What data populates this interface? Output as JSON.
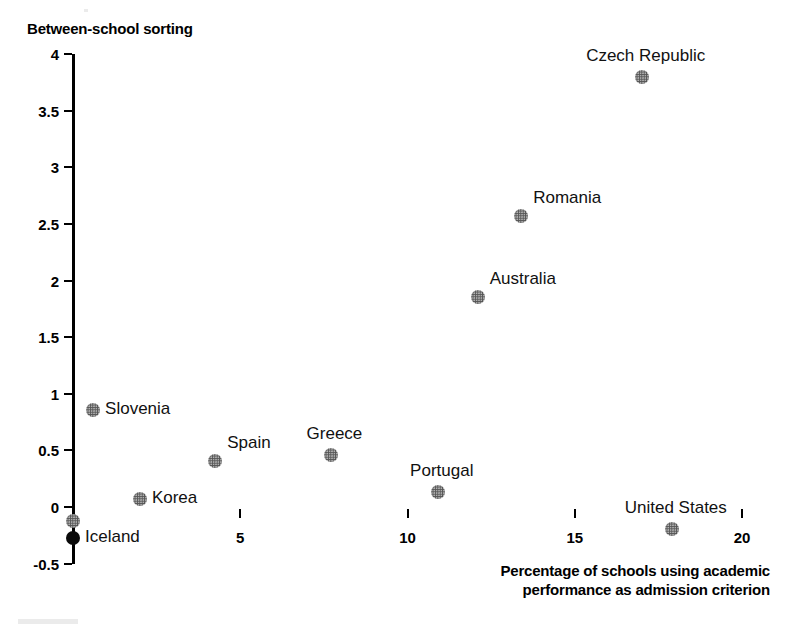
{
  "chart_data": {
    "type": "scatter",
    "title": "",
    "ylabel": "Between-school sorting",
    "xlabel": "Percentage of schools using academic performance as admission criterion",
    "xlabel_line1": "Percentage of schools using academic",
    "xlabel_line2": "performance as admission criterion",
    "xlim": [
      0,
      20
    ],
    "ylim": [
      -0.5,
      4
    ],
    "xticks": [
      0,
      5,
      10,
      15,
      20
    ],
    "xtick_labels": [
      "",
      "5",
      "10",
      "15",
      "20"
    ],
    "yticks": [
      -0.5,
      0,
      0.5,
      1,
      1.5,
      2,
      2.5,
      3,
      3.5,
      4
    ],
    "ytick_labels": [
      "-0.5",
      "0",
      "0.5",
      "1",
      "1.5",
      "2",
      "2.5",
      "3",
      "3.5",
      "4"
    ],
    "grid": false,
    "legend": "none",
    "marker_color": "#555555",
    "marker_color_alt": "#0a0a0a",
    "points": [
      {
        "label": "Czech Republic",
        "x": 17.0,
        "y": 3.8,
        "style": "halftone",
        "label_position": "above"
      },
      {
        "label": "Romania",
        "x": 13.4,
        "y": 2.57,
        "style": "halftone",
        "label_position": "upper-right"
      },
      {
        "label": "Australia",
        "x": 12.1,
        "y": 1.85,
        "style": "halftone",
        "label_position": "upper-right"
      },
      {
        "label": "Slovenia",
        "x": 0.6,
        "y": 0.86,
        "style": "halftone",
        "label_position": "right"
      },
      {
        "label": "Greece",
        "x": 7.7,
        "y": 0.46,
        "style": "halftone",
        "label_position": "above"
      },
      {
        "label": "Spain",
        "x": 4.25,
        "y": 0.41,
        "style": "halftone",
        "label_position": "upper-right"
      },
      {
        "label": "Portugal",
        "x": 10.9,
        "y": 0.13,
        "style": "halftone",
        "label_position": "above"
      },
      {
        "label": "Korea",
        "x": 2.0,
        "y": 0.07,
        "style": "halftone",
        "label_position": "right"
      },
      {
        "label": "Iceland",
        "x": 0.0,
        "y": -0.12,
        "style": "halftone",
        "label_position": "none"
      },
      {
        "label": "Iceland",
        "x": 0.0,
        "y": -0.27,
        "style": "solid",
        "label_position": "right"
      },
      {
        "label": "United States",
        "x": 17.9,
        "y": -0.19,
        "style": "halftone",
        "label_position": "above"
      }
    ]
  }
}
